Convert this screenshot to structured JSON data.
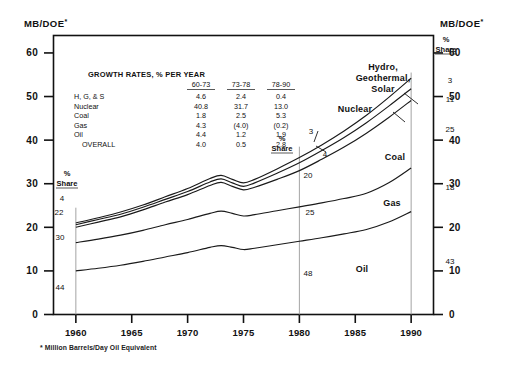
{
  "chart_data": {
    "type": "area",
    "title": "",
    "ylabel_left": "MB/DOE",
    "ylabel_right": "MB/DOE",
    "ylabel_sup": "*",
    "footnote": "* Million Barrels/Day Oil Equivalent",
    "xlabel": "",
    "xlim": [
      1958,
      1992
    ],
    "ylim": [
      0,
      64
    ],
    "grid": false,
    "y_ticks": [
      0,
      10,
      20,
      30,
      40,
      50,
      60
    ],
    "y_tick_labels": [
      "0",
      "10",
      "20",
      "30",
      "40",
      "50",
      "60"
    ],
    "x_ticks": [
      1960,
      1965,
      1970,
      1975,
      1980,
      1985,
      1990
    ],
    "x_tick_labels": [
      "1960",
      "1965",
      "1970",
      "1975",
      "1980",
      "1985",
      "1990"
    ],
    "x": [
      1960,
      1962,
      1964,
      1966,
      1968,
      1970,
      1972,
      1973,
      1974,
      1975,
      1976,
      1978,
      1980,
      1982,
      1984,
      1986,
      1988,
      1990
    ],
    "series": [
      {
        "name": "Oil",
        "label": "Oil",
        "cumulative": [
          10.0,
          10.6,
          11.3,
          12.2,
          13.2,
          14.2,
          15.4,
          15.8,
          15.4,
          14.9,
          15.2,
          16.0,
          16.8,
          17.6,
          18.5,
          19.5,
          21.2,
          23.6
        ]
      },
      {
        "name": "Gas",
        "label": "Gas",
        "cumulative": [
          16.5,
          17.3,
          18.2,
          19.3,
          20.6,
          21.8,
          23.2,
          23.7,
          23.2,
          22.6,
          22.9,
          23.8,
          24.7,
          25.6,
          26.6,
          27.8,
          30.2,
          33.6
        ]
      },
      {
        "name": "Coal",
        "label": "Coal",
        "cumulative": [
          20.0,
          21.2,
          22.4,
          24.0,
          25.8,
          27.5,
          29.6,
          30.3,
          29.4,
          28.6,
          29.2,
          31.0,
          33.0,
          35.6,
          38.4,
          41.6,
          45.2,
          49.1
        ]
      },
      {
        "name": "Nuclear",
        "label": "Nuclear",
        "cumulative": [
          20.6,
          21.8,
          23.0,
          24.6,
          26.4,
          28.2,
          30.4,
          31.1,
          30.2,
          29.4,
          30.2,
          32.4,
          34.8,
          37.6,
          40.6,
          44.0,
          47.8,
          51.8
        ]
      },
      {
        "name": "Hydro, Geothermal, Solar",
        "label": "Hydro,\nGeothermal,\nSolar",
        "cumulative": [
          21.0,
          22.2,
          23.5,
          25.1,
          27.0,
          28.9,
          31.2,
          31.9,
          31.0,
          30.2,
          31.0,
          33.4,
          36.0,
          38.9,
          42.1,
          45.7,
          49.8,
          54.2
        ]
      }
    ],
    "series_labels": [
      {
        "text": "Hydro,",
        "x": 383,
        "y": 70
      },
      {
        "text": "Geothermal,",
        "x": 383,
        "y": 81
      },
      {
        "text": "Solar",
        "x": 383,
        "y": 92
      },
      {
        "text": "Nuclear",
        "x": 355,
        "y": 112
      },
      {
        "text": "Coal",
        "x": 395,
        "y": 160
      },
      {
        "text": "Gas",
        "x": 392,
        "y": 206
      },
      {
        "text": "Oil",
        "x": 362,
        "y": 272
      }
    ],
    "share_annotations": {
      "header_line1": "%",
      "header_line2": "Share",
      "left": {
        "year": 1960,
        "header_x": 67,
        "header_y1": 176,
        "header_y2": 186,
        "values": [
          "4",
          "22",
          "30",
          "44"
        ],
        "positions": [
          [
            62,
            201
          ],
          [
            59,
            215
          ],
          [
            60,
            240
          ],
          [
            60,
            290
          ]
        ]
      },
      "middle": {
        "year": 1980,
        "header_x": 282,
        "header_y1": 141,
        "header_y2": 151,
        "values": [
          "3",
          "4",
          "20",
          "25",
          "48"
        ],
        "positions": [
          [
            311,
            134
          ],
          [
            325,
            157
          ],
          [
            308,
            178
          ],
          [
            310,
            215
          ],
          [
            308,
            276
          ]
        ]
      },
      "right": {
        "year": 1990,
        "header_x": 446,
        "header_y1": 42,
        "header_y2": 52,
        "values": [
          "3",
          "11",
          "25",
          "18",
          "43"
        ],
        "positions": [
          [
            450,
            83
          ],
          [
            450,
            102
          ],
          [
            450,
            132
          ],
          [
            450,
            190
          ],
          [
            450,
            264
          ]
        ]
      }
    },
    "growth_table": {
      "title": "GROWTH  RATES, % PER YEAR",
      "columns": [
        "60-73",
        "73-78",
        "78-90"
      ],
      "rows": [
        {
          "label": "H, G, & S",
          "values": [
            "4.6",
            "2.4",
            "0.4"
          ]
        },
        {
          "label": "Nuclear",
          "values": [
            "40.8",
            "31.7",
            "13.0"
          ]
        },
        {
          "label": "Coal",
          "values": [
            "1.8",
            "2.5",
            "5.3"
          ]
        },
        {
          "label": "Gas",
          "values": [
            "4.3",
            "(4.0)",
            "(0.2)"
          ]
        },
        {
          "label": "Oil",
          "values": [
            "4.4",
            "1.2",
            "1.9"
          ]
        },
        {
          "label": "OVERALL",
          "values": [
            "4.0",
            "0.5",
            "2.8"
          ]
        }
      ]
    },
    "colors": {
      "ink": "#111111",
      "background": "#ffffff",
      "share_rule": "#9a9a9a"
    }
  }
}
